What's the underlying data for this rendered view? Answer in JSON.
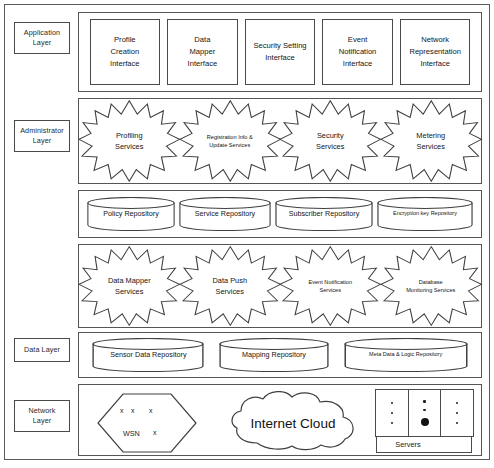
{
  "layers": [
    {
      "id": "application",
      "label": "Application\nLayer"
    },
    {
      "id": "administrator",
      "label": "Administrator\nLayer"
    },
    {
      "id": "data",
      "label": "Data Layer"
    },
    {
      "id": "network",
      "label": "Network\nLayer"
    }
  ],
  "application_layer": {
    "interfaces": [
      {
        "label": "Profile\nCreation\nInterface"
      },
      {
        "label": "Data\nMapper\nInterface"
      },
      {
        "label": "Security Setting\nInterface"
      },
      {
        "label": "Event\nNotification\nInterface"
      },
      {
        "label": "Network\nRepresentation\nInterface"
      }
    ]
  },
  "administrator_layer": {
    "services_row_1": [
      {
        "label": "Profiling\nServices",
        "size": "normal"
      },
      {
        "label": "Registration Info &\nUpdate Services",
        "size": "small"
      },
      {
        "label": "Security\nServices",
        "size": "normal"
      },
      {
        "label": "Metering\nServices",
        "size": "normal"
      }
    ],
    "repositories_row_1": [
      {
        "label": "Policy Repository",
        "size": "normal"
      },
      {
        "label": "Service Repository",
        "size": "normal"
      },
      {
        "label": "Subscriber Repository",
        "size": "normal"
      },
      {
        "label": "Encryption key Repository",
        "size": "tiny"
      }
    ],
    "services_row_2": [
      {
        "label": "Data Mapper\nServices",
        "size": "normal"
      },
      {
        "label": "Data Push\nServices",
        "size": "normal"
      },
      {
        "label": "Event Notification\nServices",
        "size": "small"
      },
      {
        "label": "Database\nMonitoring Services",
        "size": "small"
      }
    ]
  },
  "data_layer": {
    "repositories": [
      {
        "label": "Sensor Data Repository",
        "size": "normal"
      },
      {
        "label": "Mapping Repository",
        "size": "normal"
      },
      {
        "label": "Meta Data & Logic Repository",
        "size": "tiny"
      }
    ]
  },
  "network_layer": {
    "wsn": {
      "name": "WSN",
      "nodes": [
        "x",
        "x",
        "x",
        "x"
      ]
    },
    "cloud": {
      "label": "Internet Cloud"
    },
    "servers": {
      "label": "Servers",
      "racks": [
        {
          "dots": [
            "small",
            "small",
            "small"
          ]
        },
        {
          "dots": [
            "small",
            "small",
            "big"
          ]
        },
        {
          "dots": [
            "small",
            "small",
            "small"
          ]
        }
      ]
    }
  },
  "colors": {
    "stroke": "#4a4a4a",
    "frame": "#5a5a5a",
    "text": "#141414",
    "background": "#ffffff"
  }
}
